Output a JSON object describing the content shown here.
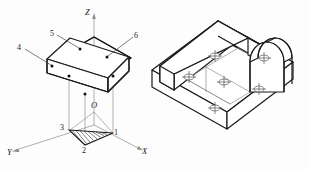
{
  "figure": {
    "background_color": "#fdfdfd",
    "line_color": "#1a1a1a",
    "thin_line_color": "#8a8a8a"
  },
  "left_diagram": {
    "name": "axonometric-axes-and-slab",
    "axes": [
      {
        "id": "z",
        "label": "Z",
        "direction": "up"
      },
      {
        "id": "x",
        "label": "X",
        "direction": "lower-right"
      },
      {
        "id": "y",
        "label": "Y",
        "direction": "lower-left"
      },
      {
        "id": "o",
        "label": "O",
        "direction": "origin"
      }
    ],
    "point_labels": [
      {
        "id": "p1",
        "label": "1"
      },
      {
        "id": "p2",
        "label": "2"
      },
      {
        "id": "p3",
        "label": "3"
      },
      {
        "id": "p4",
        "label": "4"
      },
      {
        "id": "p5",
        "label": "5"
      },
      {
        "id": "p6",
        "label": "6"
      }
    ],
    "solid": "rectangular slab drawn in isometric with six marked surface points",
    "projection": "hatched triangle below the slab formed by projector lines to points 1, 2 and 3"
  },
  "right_diagram": {
    "name": "isometric-machine-part",
    "features": [
      {
        "id": "base-plate",
        "label": "base plate"
      },
      {
        "id": "back-wall",
        "label": "back wall"
      },
      {
        "id": "side-wall",
        "label": "side wall"
      },
      {
        "id": "arch-block",
        "label": "semicircular arch block"
      },
      {
        "id": "hole-a",
        "label": "hole"
      },
      {
        "id": "hole-b",
        "label": "hole"
      },
      {
        "id": "hole-c",
        "label": "hole"
      },
      {
        "id": "hole-d",
        "label": "hole"
      },
      {
        "id": "hole-e",
        "label": "hole"
      },
      {
        "id": "hole-f",
        "label": "hole"
      }
    ]
  }
}
